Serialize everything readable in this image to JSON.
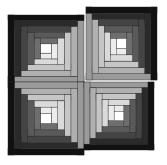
{
  "image": {
    "description": "Log cabin quilt pattern: four square blocks of concentric grayscale strips arranged in a 2x2 grid",
    "background": "#ffffff"
  },
  "blocks": [
    {
      "name": "top-left",
      "x": 8,
      "y": 15,
      "w": 76,
      "h": 67,
      "dark_sides": [
        "top",
        "left"
      ],
      "light_sides": [
        "bottom",
        "right"
      ]
    },
    {
      "name": "top-right",
      "x": 86,
      "y": 7,
      "w": 71,
      "h": 73,
      "dark_sides": [
        "top",
        "right"
      ],
      "light_sides": [
        "bottom",
        "left"
      ]
    },
    {
      "name": "bottom-left",
      "x": 8,
      "y": 82,
      "w": 76,
      "h": 73,
      "dark_sides": [
        "bottom",
        "left"
      ],
      "light_sides": [
        "top",
        "right"
      ]
    },
    {
      "name": "bottom-right",
      "x": 84,
      "y": 82,
      "w": 70,
      "h": 68,
      "dark_sides": [
        "bottom",
        "right"
      ],
      "light_sides": [
        "top",
        "left"
      ]
    }
  ],
  "palette": {
    "darks": [
      "#111111",
      "#2a2a2a",
      "#444444",
      "#5a5a5a",
      "#6e6e6e"
    ],
    "lights": [
      "#9a9a9a",
      "#b0b0b0",
      "#c6c6c6",
      "#dadada",
      "#ececec"
    ],
    "center": "#ffffff"
  }
}
